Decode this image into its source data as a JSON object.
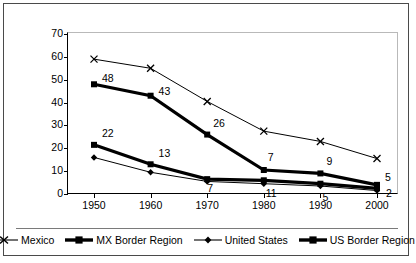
{
  "chart_data": {
    "type": "line",
    "title": "",
    "xlabel": "",
    "ylabel": "Percent of Labor Force",
    "categories": [
      "1950",
      "1960",
      "1970",
      "1980",
      "1990",
      "2000"
    ],
    "x": [
      1950,
      1960,
      1970,
      1980,
      1990,
      2000
    ],
    "ylim": [
      0,
      70
    ],
    "yticks": [
      "0",
      "10",
      "20",
      "30",
      "40",
      "50",
      "60",
      "70"
    ],
    "grid": false,
    "legend_position": "bottom",
    "series": [
      {
        "name": "Mexico",
        "marker": "x",
        "values": [
          59,
          55,
          40.5,
          27.5,
          23,
          15.5
        ],
        "labels": [
          "",
          "",
          "",
          "",
          "",
          ""
        ]
      },
      {
        "name": "MX Border Region",
        "marker": "square",
        "values": [
          48,
          43,
          26,
          10.5,
          9,
          4
        ],
        "labels": [
          "48",
          "43",
          "26",
          "7",
          "9",
          "5"
        ]
      },
      {
        "name": "United States",
        "marker": "diamond",
        "values": [
          16,
          9.5,
          5.5,
          4.5,
          3.5,
          1.5
        ],
        "labels": [
          "",
          "",
          "",
          "11",
          "5",
          "2"
        ]
      },
      {
        "name": "US Border Region",
        "marker": "square",
        "values": [
          21.5,
          13,
          6.5,
          6,
          4.5,
          2.5
        ],
        "labels": [
          "22",
          "13",
          "7",
          "",
          "",
          ""
        ]
      }
    ],
    "point_labels": [
      {
        "text": "48",
        "x": 1950,
        "y": 48,
        "dx": 8,
        "dy": -6
      },
      {
        "text": "43",
        "x": 1960,
        "y": 43,
        "dx": 8,
        "dy": -5
      },
      {
        "text": "26",
        "x": 1970,
        "y": 26,
        "dx": 6,
        "dy": -12
      },
      {
        "text": "7",
        "x": 1980,
        "y": 10.5,
        "dx": 4,
        "dy": -13
      },
      {
        "text": "9",
        "x": 1990,
        "y": 9,
        "dx": 6,
        "dy": -12
      },
      {
        "text": "5",
        "x": 2000,
        "y": 4,
        "dx": 8,
        "dy": -8
      },
      {
        "text": "22",
        "x": 1950,
        "y": 21.5,
        "dx": 8,
        "dy": -12
      },
      {
        "text": "13",
        "x": 1960,
        "y": 13,
        "dx": 8,
        "dy": -11
      },
      {
        "text": "7",
        "x": 1970,
        "y": 6.5,
        "dx": 0,
        "dy": 9
      },
      {
        "text": "11",
        "x": 1980,
        "y": 4.5,
        "dx": 2,
        "dy": 9
      },
      {
        "text": "5",
        "x": 1990,
        "y": 3.5,
        "dx": 2,
        "dy": 11
      },
      {
        "text": "2",
        "x": 2000,
        "y": 1.5,
        "dx": 9,
        "dy": 2
      }
    ]
  },
  "legend": {
    "items": [
      {
        "label": "Mexico",
        "marker": "x-marker",
        "weight": "thin"
      },
      {
        "label": "MX Border Region",
        "marker": "square-marker",
        "weight": "thick"
      },
      {
        "label": "United States",
        "marker": "diamond-marker",
        "weight": "thin"
      },
      {
        "label": "US Border Region",
        "marker": "square-marker",
        "weight": "thick"
      }
    ]
  },
  "colors": {
    "line": "#000000",
    "border": "#4a4a4a",
    "plot_border": "#b9b9b9",
    "background": "#ffffff"
  }
}
